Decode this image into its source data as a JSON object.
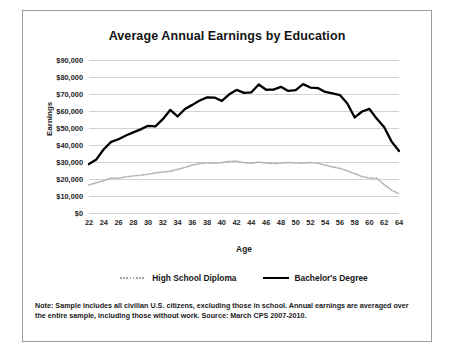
{
  "chart_data": {
    "type": "line",
    "title": "Average Annual Earnings by Education",
    "xlabel": "Age",
    "ylabel": "Earnings",
    "xlim": [
      22,
      64
    ],
    "ylim": [
      0,
      90000
    ],
    "grid": true,
    "legend_position": "bottom",
    "x": [
      22,
      23,
      24,
      25,
      26,
      27,
      28,
      29,
      30,
      31,
      32,
      33,
      34,
      35,
      36,
      37,
      38,
      39,
      40,
      41,
      42,
      43,
      44,
      45,
      46,
      47,
      48,
      49,
      50,
      51,
      52,
      53,
      54,
      55,
      56,
      57,
      58,
      59,
      60,
      61,
      62,
      63,
      64
    ],
    "xtick_labels": [
      "22",
      "24",
      "26",
      "28",
      "30",
      "32",
      "34",
      "36",
      "38",
      "40",
      "42",
      "44",
      "46",
      "48",
      "50",
      "52",
      "54",
      "56",
      "58",
      "60",
      "62",
      "64"
    ],
    "ytick_labels": [
      "$90,000",
      "$80,000",
      "$70,000",
      "$60,000",
      "$50,000",
      "$40,000",
      "$30,000",
      "$20,000",
      "$10,000",
      "$0"
    ],
    "ytick_values": [
      90000,
      80000,
      70000,
      60000,
      50000,
      40000,
      30000,
      20000,
      10000,
      0
    ],
    "series": [
      {
        "name": "High School Diploma",
        "style": "dotted",
        "color": "#a8a8a8",
        "values": [
          16500,
          17800,
          19000,
          20600,
          20400,
          21300,
          21800,
          22200,
          22800,
          23600,
          24100,
          24500,
          25700,
          26800,
          28200,
          29100,
          29400,
          29300,
          29600,
          30400,
          30500,
          29600,
          29300,
          29900,
          29400,
          29100,
          29300,
          29700,
          29400,
          29300,
          29700,
          29200,
          28200,
          27100,
          26200,
          24800,
          23200,
          21400,
          20600,
          20400,
          16700,
          13400,
          11300
        ]
      },
      {
        "name": "Bachelor's Degree",
        "style": "solid",
        "color": "#000000",
        "values": [
          28800,
          31500,
          37500,
          41800,
          43400,
          45600,
          47400,
          49200,
          51300,
          51000,
          55200,
          60600,
          56800,
          61200,
          63600,
          66200,
          68000,
          67900,
          65900,
          69800,
          72400,
          70700,
          71000,
          75600,
          72500,
          72600,
          74200,
          71800,
          72300,
          75800,
          73800,
          73500,
          71200,
          70300,
          69400,
          64400,
          56200,
          59700,
          61200,
          55400,
          50400,
          42000,
          36500
        ]
      }
    ]
  },
  "note": {
    "line1": "Note: Sample includes all civilian U.S. citizens, excluding those in school. Annual earnings are averaged over the",
    "line2": "entire sample, including those without work. Source: March CPS 2007-2010."
  }
}
